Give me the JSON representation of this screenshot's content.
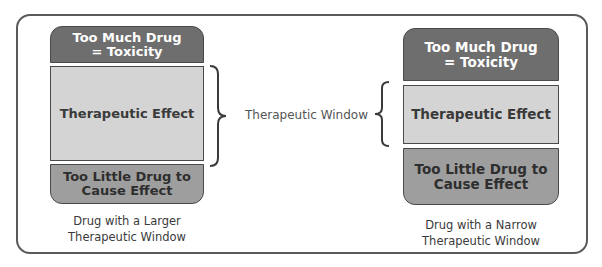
{
  "diagram": {
    "center_label": "Therapeutic Window",
    "colors": {
      "toxicity": "#6e6e6e",
      "therapeutic": "#d4d4d4",
      "too_little": "#9e9e9e",
      "frame": "#5a5a5a"
    },
    "left": {
      "toxicity_label": "Too Much Drug = Toxicity",
      "therapeutic_label": "Therapeutic Effect",
      "too_little_label": "Too Little Drug to Cause Effect",
      "caption_line1": "Drug with a Larger",
      "caption_line2": "Therapeutic Window"
    },
    "right": {
      "toxicity_label": "Too Much Drug = Toxicity",
      "therapeutic_label": "Therapeutic Effect",
      "too_little_label": "Too Little Drug to Cause Effect",
      "caption_line1": "Drug with a Narrow",
      "caption_line2": "Therapeutic Window"
    }
  }
}
